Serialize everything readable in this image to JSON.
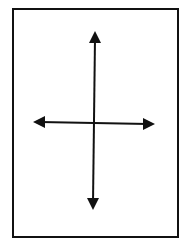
{
  "diagram": {
    "colors": {
      "background": "#ffffff",
      "stroke": "#111111"
    },
    "frame": {
      "x": 13,
      "y": 9,
      "width": 165,
      "height": 228,
      "stroke_width": 2
    },
    "center": {
      "x": 94,
      "y": 123
    },
    "arrows": [
      {
        "direction": "up",
        "tip": {
          "x": 95,
          "y": 31
        }
      },
      {
        "direction": "down",
        "tip": {
          "x": 93,
          "y": 210
        }
      },
      {
        "direction": "left",
        "tip": {
          "x": 33,
          "y": 122
        }
      },
      {
        "direction": "right",
        "tip": {
          "x": 155,
          "y": 124
        }
      }
    ]
  }
}
